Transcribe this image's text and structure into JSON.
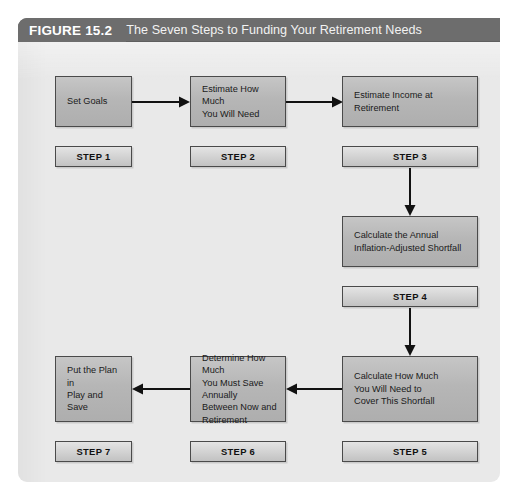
{
  "figure": {
    "label": "FIGURE 15.2",
    "title": "The Seven Steps to Funding Your Retirement Needs",
    "header_bg": "#6d6d6d",
    "panel_bg": "#e9e9e9",
    "box_fill": "#b6b6b6",
    "box_border": "#4a4a4a",
    "step_fill": "#d3d3d3",
    "arrow_color": "#111111"
  },
  "boxes": [
    {
      "id": "box-1",
      "text": "Set Goals"
    },
    {
      "id": "box-2",
      "text": "Estimate How Much You Will Need"
    },
    {
      "id": "box-3",
      "text": "Estimate Income at Retirement"
    },
    {
      "id": "box-4",
      "text": "Calculate the Annual Inflation-Adjusted Shortfall"
    },
    {
      "id": "box-5",
      "text": "Calculate How Much You Will Need to Cover This Shortfall"
    },
    {
      "id": "box-6",
      "text": "Determine How Much You Must Save Annually Between Now and Retirement"
    },
    {
      "id": "box-7",
      "text": "Put the Plan in Play and Save"
    }
  ],
  "box_lines": {
    "box_1": [
      "Set Goals"
    ],
    "box_2": [
      "Estimate How Much",
      "You Will Need"
    ],
    "box_3": [
      "Estimate Income at",
      "Retirement"
    ],
    "box_4": [
      "Calculate the Annual",
      "Inflation-Adjusted Shortfall"
    ],
    "box_5": [
      "Calculate How Much",
      "You Will Need to",
      "Cover This Shortfall"
    ],
    "box_6": [
      "Determine How Much",
      "You Must Save Annually",
      "Between Now and",
      "Retirement"
    ],
    "box_7": [
      "Put the Plan in",
      "Play and Save"
    ]
  },
  "steps": [
    {
      "id": "step-1",
      "label": "STEP 1"
    },
    {
      "id": "step-2",
      "label": "STEP 2"
    },
    {
      "id": "step-3",
      "label": "STEP 3"
    },
    {
      "id": "step-4",
      "label": "STEP 4"
    },
    {
      "id": "step-5",
      "label": "STEP 5"
    },
    {
      "id": "step-6",
      "label": "STEP 6"
    },
    {
      "id": "step-7",
      "label": "STEP 7"
    }
  ],
  "arrows": [
    {
      "id": "arrow-1-to-2",
      "direction": "right"
    },
    {
      "id": "arrow-2-to-3",
      "direction": "right"
    },
    {
      "id": "arrow-step3-to-box4",
      "direction": "down"
    },
    {
      "id": "arrow-step4-to-box5",
      "direction": "down"
    },
    {
      "id": "arrow-box5-to-box6",
      "direction": "left"
    },
    {
      "id": "arrow-box6-to-box7",
      "direction": "left"
    }
  ]
}
